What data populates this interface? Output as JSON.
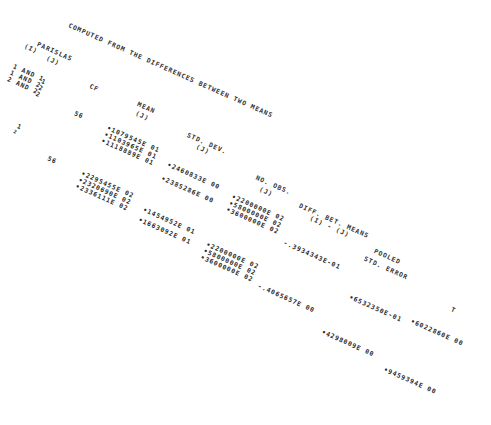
{
  "document": {
    "title": "COMPUTED FROM THE DIFFERENCES BETWEEN TWO MEANS",
    "headers": {
      "pair_i": "(I)",
      "pair_label": "PARISLAS",
      "pair_j": "(J)",
      "cf": "CF",
      "mean": "MEAN",
      "mean_j": "(J)",
      "std_dev": "STD. DEV.",
      "std_dev_j": "(J)",
      "no_obs": "NO. OBS.",
      "no_obs_j": "(J)",
      "diff_means": "DIFF. BET. MEANS",
      "diff_means_ij": "(I) - (J)",
      "pooled": "POOLED",
      "std_error": "STD. ERROR",
      "t": "T"
    },
    "pairs": [
      "1 AND 1",
      "1 AND 2",
      "2 AND 2"
    ],
    "pair_j_col": [
      "1",
      "2",
      "2"
    ],
    "groups": [
      {
        "i_label": "1",
        "i_sub": "2",
        "df": "56",
        "df_top": "56",
        "means": [
          "•1079545E 01",
          "•1103965E 01",
          "•1118889E 01"
        ],
        "std_devs": [
          "•2460833E 00",
          "•2385286E 00"
        ],
        "n_obs": [
          "•2200000E 02",
          "•5800000E 02",
          "•3600000E 02"
        ],
        "diff": "-.3934343E-01",
        "pooled_se": "•6532350E-01",
        "t": "•6022860E 00"
      },
      {
        "df": "56",
        "means": [
          "•2295455E 02",
          "•2320690E 02",
          "•2336111E 02"
        ],
        "std_devs": [
          "•1454952E 01",
          "•1663092E 01"
        ],
        "n_obs": [
          "•2200000E 02",
          "•5800000E 02",
          "•3600000E 02"
        ],
        "diff": "-.4065657E 00",
        "pooled_se": "•4298009E 00",
        "t": "•9459394E 00"
      }
    ]
  }
}
